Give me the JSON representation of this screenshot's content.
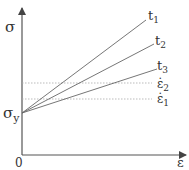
{
  "diagram": {
    "axes": {
      "y_label": "σ",
      "x_label": "ε",
      "origin_label": "0",
      "yield_label_main": "σ",
      "yield_label_sub": "y"
    },
    "lines": [
      {
        "label_main": "t",
        "label_sub": "1"
      },
      {
        "label_main": "t",
        "label_sub": "2"
      },
      {
        "label_main": "t",
        "label_sub": "3"
      }
    ],
    "rate_levels": [
      {
        "label_main": "ε̇",
        "label_sub": "2"
      },
      {
        "label_main": "ε̇",
        "label_sub": "1"
      }
    ],
    "colors": {
      "axis": "#555555",
      "line": "#666666",
      "dotted": "#aaaaaa",
      "text": "#333333"
    }
  }
}
